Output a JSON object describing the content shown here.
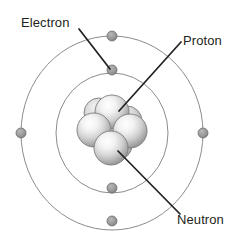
{
  "diagram": {
    "type": "bohr-atom-model",
    "canvas": {
      "width": 235,
      "height": 238,
      "background": "#ffffff"
    },
    "center": {
      "x": 112,
      "y": 133
    },
    "colors": {
      "orbit_stroke": "#8c8c8c",
      "electron_fill": "#9a9a9a",
      "electron_stroke": "#6e6e6e",
      "leader_line": "#231f20",
      "label_text": "#231f20",
      "nucleon_light": "#ffffff",
      "nucleon_mid": "#d6d6d6",
      "nucleon_dark": "#8f8f8f",
      "nucleon_stroke": "#7a7a7a"
    },
    "labels": [
      {
        "id": "electron",
        "text": "Electron",
        "x": 21,
        "y": 15,
        "leader_from": {
          "x": 79,
          "y": 29
        },
        "leader_to": {
          "x": 110,
          "y": 69
        }
      },
      {
        "id": "proton",
        "text": "Proton",
        "x": 183,
        "y": 33,
        "leader_from": {
          "x": 181,
          "y": 42
        },
        "leader_to": {
          "x": 119,
          "y": 111
        }
      },
      {
        "id": "neutron",
        "text": "Neutron",
        "x": 177,
        "y": 212,
        "leader_from": {
          "x": 180,
          "y": 214
        },
        "leader_to": {
          "x": 118,
          "y": 151
        }
      }
    ],
    "orbits": [
      {
        "id": "outer-shell",
        "rx": 91,
        "ry": 97,
        "stroke_width": 1
      },
      {
        "id": "inner-shell",
        "rx": 56,
        "ry": 60,
        "stroke_width": 1
      }
    ],
    "electrons": [
      {
        "id": "electron-outer-top",
        "shell": "outer-shell",
        "x": 112,
        "y": 36,
        "r": 5
      },
      {
        "id": "electron-outer-left",
        "shell": "outer-shell",
        "x": 21,
        "y": 133,
        "r": 5
      },
      {
        "id": "electron-outer-right",
        "shell": "outer-shell",
        "x": 203,
        "y": 133,
        "r": 5
      },
      {
        "id": "electron-outer-bottom",
        "shell": "outer-shell",
        "x": 112,
        "y": 221,
        "r": 5
      },
      {
        "id": "electron-inner-top",
        "shell": "inner-shell",
        "x": 112,
        "y": 70,
        "r": 5
      },
      {
        "id": "electron-inner-bottom",
        "shell": "inner-shell",
        "x": 112,
        "y": 188,
        "r": 5
      }
    ],
    "nucleus": {
      "id": "nucleus",
      "particles": [
        {
          "id": "nucleon-back-left",
          "x": 99,
          "y": 113,
          "r": 15,
          "layer": "back"
        },
        {
          "id": "nucleon-back-right",
          "x": 127,
          "y": 121,
          "r": 15,
          "layer": "back"
        },
        {
          "id": "nucleon-back-bottom",
          "x": 117,
          "y": 145,
          "r": 15,
          "layer": "back"
        },
        {
          "id": "nucleon-top",
          "x": 112,
          "y": 112,
          "r": 17,
          "layer": "front"
        },
        {
          "id": "nucleon-left",
          "x": 94,
          "y": 130,
          "r": 17,
          "layer": "front"
        },
        {
          "id": "nucleon-right",
          "x": 130,
          "y": 131,
          "r": 17,
          "layer": "front"
        },
        {
          "id": "nucleon-bottom",
          "x": 111,
          "y": 148,
          "r": 17,
          "layer": "front"
        }
      ]
    }
  }
}
